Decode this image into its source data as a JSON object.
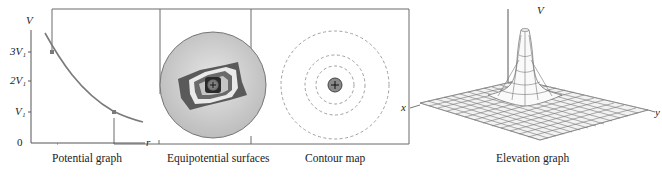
{
  "panels": [
    {
      "id": "potential-graph",
      "caption": "Potential graph"
    },
    {
      "id": "equipotential-surfaces",
      "caption": "Equipotential surfaces"
    },
    {
      "id": "contour-map",
      "caption": "Contour map"
    },
    {
      "id": "elevation-graph",
      "caption": "Elevation graph"
    }
  ],
  "potential_graph": {
    "y_axis_label": "V",
    "x_axis_label": "r",
    "ticks": [
      "3V₁",
      "2V₁",
      "V₁",
      "0"
    ]
  },
  "elevation_graph": {
    "axis_v": "V",
    "axis_x": "x",
    "axis_y": "y"
  },
  "charge_symbol": "+",
  "colors": {
    "line": "#6b6b6b",
    "curve": "#7a7a7a",
    "sphere": "#c8c8c8",
    "dashed": "#999999",
    "dark": "#3a3a3a"
  }
}
